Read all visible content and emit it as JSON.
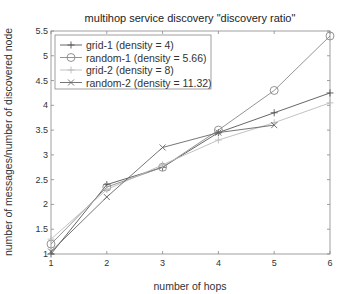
{
  "chart_data": {
    "type": "line",
    "title": "multihop service discovery \"discovery ratio\"",
    "xlabel": "number of hops",
    "ylabel": "number of messages/number of discovered node",
    "xlim": [
      1,
      6
    ],
    "ylim": [
      1,
      5.5
    ],
    "xticks": [
      "1",
      "2",
      "3",
      "4",
      "5",
      "6"
    ],
    "yticks": [
      "1",
      "1.5",
      "2",
      "2.5",
      "3",
      "3.5",
      "4",
      "4.5",
      "5",
      "5.5"
    ],
    "grid": false,
    "legend_position": "upper-left",
    "series": [
      {
        "name": "grid-1 (density = 4)",
        "marker": "plus",
        "style": "solid",
        "color": "#555555",
        "x": [
          1,
          2,
          3,
          4,
          5,
          6
        ],
        "values": [
          1.0,
          2.4,
          2.75,
          3.45,
          3.85,
          4.25
        ]
      },
      {
        "name": "random-1 (density = 5.66)",
        "marker": "circle",
        "style": "solid",
        "color": "#888888",
        "x": [
          1,
          2,
          3,
          4,
          5,
          6
        ],
        "values": [
          1.2,
          2.35,
          2.75,
          3.5,
          4.3,
          5.4
        ]
      },
      {
        "name": "grid-2 (density = 8)",
        "marker": "plus",
        "style": "solid",
        "color": "#bbbbbb",
        "x": [
          1,
          2,
          3,
          4,
          5,
          6
        ],
        "values": [
          1.3,
          2.3,
          2.8,
          3.3,
          3.65,
          4.05
        ]
      },
      {
        "name": "random-2 (density = 11.32)",
        "marker": "x",
        "style": "solid",
        "color": "#666666",
        "x": [
          1,
          2,
          3,
          4,
          5
        ],
        "values": [
          1.05,
          2.15,
          3.15,
          3.45,
          3.6
        ]
      }
    ]
  }
}
